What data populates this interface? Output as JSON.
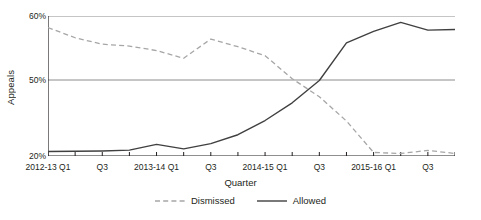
{
  "chart_data": {
    "type": "line",
    "title": "",
    "xlabel": "Quarter",
    "ylabel": "Appeals",
    "ylim": [
      20,
      60
    ],
    "y_axis_break": true,
    "yticks": [
      "20%",
      "50%",
      "60%"
    ],
    "ytick_values": [
      20,
      50,
      60
    ],
    "grid": "horizontal",
    "legend_position": "bottom",
    "x": [
      "2012-13 Q1",
      "2012-13 Q2",
      "2012-13 Q3",
      "2012-13 Q4",
      "2013-14 Q1",
      "2013-14 Q2",
      "2013-14 Q3",
      "2013-14 Q4",
      "2014-15 Q1",
      "2014-15 Q2",
      "2014-15 Q3",
      "2014-15 Q4",
      "2015-16 Q1",
      "2015-16 Q2",
      "2015-16 Q3",
      "2015-16 Q4"
    ],
    "xtick_labels": [
      "2012-13 Q1",
      "Q3",
      "2013-14 Q1",
      "Q3",
      "2014-15 Q1",
      "Q3",
      "2015-16 Q1",
      "Q3"
    ],
    "xtick_indices": [
      0,
      2,
      4,
      6,
      8,
      10,
      12,
      14
    ],
    "series": [
      {
        "name": "Dismissed",
        "style": "dashed",
        "color": "#a6a6a6",
        "values": [
          58.2,
          56.6,
          55.6,
          55.3,
          54.6,
          53.4,
          56.4,
          55.2,
          53.8,
          50.2,
          43.4,
          33.8,
          21.4,
          21.0,
          22.2,
          21.0
        ]
      },
      {
        "name": "Allowed",
        "style": "solid",
        "color": "#404040",
        "values": [
          21.8,
          21.9,
          22.0,
          22.3,
          24.6,
          22.8,
          24.9,
          28.4,
          34.0,
          41.0,
          49.8,
          55.8,
          57.6,
          59.0,
          57.8,
          57.9
        ]
      }
    ]
  },
  "legend": {
    "items": [
      {
        "label": "Dismissed",
        "style": "dashed"
      },
      {
        "label": "Allowed",
        "style": "solid"
      }
    ]
  }
}
